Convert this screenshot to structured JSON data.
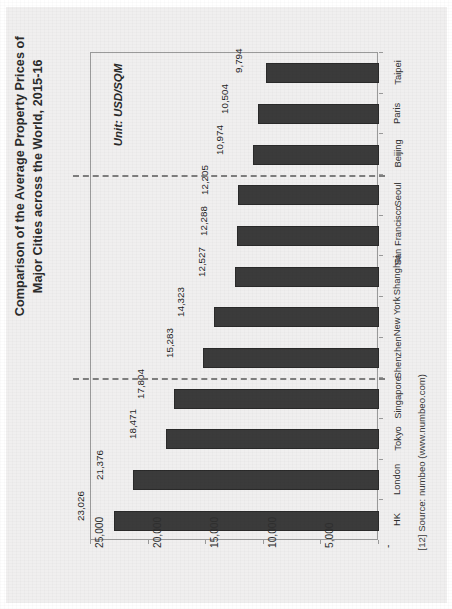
{
  "figure": {
    "title": "Comparison of the Average Property Prices of Major Cities across the World, 2015-16",
    "unit_note": "Unit: USD/SQM",
    "source_note": "[12] Source: numbeo (www.numbeo.com)"
  },
  "colors": {
    "page_background": "#f0efef",
    "bar_fill": "#3b3b3b",
    "bar_stroke": "#2a2a2a",
    "axis_line": "#9a9a9a",
    "divider": "#7e7e7e",
    "text": "#2b2b2b"
  },
  "chart_data": {
    "type": "bar",
    "orientation": "horizontal-rotated",
    "title": "Comparison of the Average Property Prices of Major Cities across the World, 2015-16",
    "xlabel": "",
    "ylabel": "Unit: USD/SQM",
    "categories": [
      "HK",
      "London",
      "Tokyo",
      "Singapore",
      "Shenzhen",
      "New York",
      "Shanghai",
      "San Francisco",
      "Seoul",
      "Beijing",
      "Paris",
      "Taipei"
    ],
    "values": [
      23026,
      21376,
      18471,
      17804,
      15283,
      14323,
      12527,
      12288,
      12205,
      10974,
      10504,
      9794
    ],
    "value_labels": [
      "23,026",
      "21,376",
      "18,471",
      "17,804",
      "15,283",
      "14,323",
      "12,527",
      "12,288",
      "12,205",
      "10,974",
      "10,504",
      "9,794"
    ],
    "ylim": [
      0,
      25000
    ],
    "tick_values": [
      25000,
      20000,
      15000,
      10000,
      5000,
      0
    ],
    "tick_labels": [
      "25,000",
      "20,000",
      "15,000",
      "10,000",
      "5,000",
      "-"
    ],
    "grid": false,
    "legend": "none",
    "annotations": [
      {
        "type": "dashed-divider",
        "after_category": "Singapore"
      },
      {
        "type": "dashed-divider",
        "after_category": "Seoul"
      }
    ]
  }
}
